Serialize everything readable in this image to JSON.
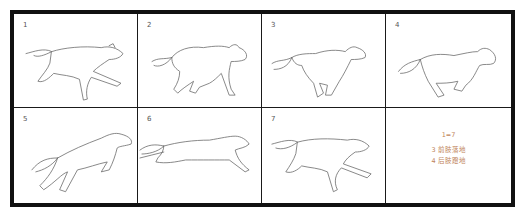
{
  "storyboard": {
    "subject": "dog running cycle",
    "panels": [
      {
        "number": "1",
        "pose": "extended stretch, front legs reaching forward"
      },
      {
        "number": "2",
        "pose": "gathered, legs under body"
      },
      {
        "number": "3",
        "pose": "front legs landing"
      },
      {
        "number": "4",
        "pose": "hind legs pushing off"
      },
      {
        "number": "5",
        "pose": "leap, hind legs extended back"
      },
      {
        "number": "6",
        "pose": "full extension, airborne"
      },
      {
        "number": "7",
        "pose": "extended stretch (same as 1)"
      }
    ],
    "notes": {
      "equivalence": "1=7",
      "line_1": "3 前肢落地",
      "line_2": "4 后肢蹬地"
    },
    "caption": "",
    "colors": {
      "frame": "#111111",
      "sketch": "#6a6a6a",
      "note_text": "#c0835a"
    }
  }
}
